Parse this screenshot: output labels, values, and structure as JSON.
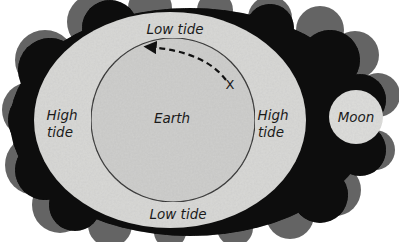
{
  "diagram": {
    "type": "tidal-bulge-diagram",
    "labels": {
      "low_tide_top": "Low tide",
      "low_tide_bottom": "Low tide",
      "high_tide_left_line1": "High",
      "high_tide_left_line2": "tide",
      "high_tide_right_line1": "High",
      "high_tide_right_line2": "tide",
      "earth": "Earth",
      "moon": "Moon",
      "x_marker": "X"
    },
    "colors": {
      "background": "#ffffff",
      "space_dark": "#141414",
      "space_halo": "#4a4a4a",
      "tidal_bulge": "#d9d9d7",
      "earth_fill": "#cfcfcd",
      "earth_outline": "#2a2a2a",
      "moon_fill": "#dededc",
      "arrow": "#111111"
    }
  }
}
